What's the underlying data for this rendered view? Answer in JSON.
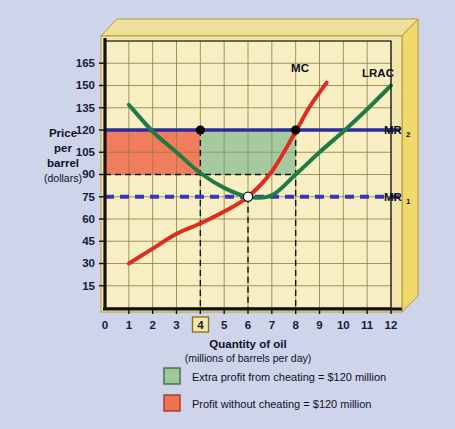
{
  "figure": {
    "background_color": "#ced4ea",
    "panel_color": "#f4e9b8",
    "frame_color": "#efdc8c",
    "frame_edge_color": "#c9ab3f"
  },
  "axes": {
    "y_label_line1": "Price",
    "y_label_line2": "per",
    "y_label_line3": "barrel",
    "y_label_line4": "(dollars)",
    "x_title": "Quantity of oil",
    "x_subtitle": "(millions of barrels per day)",
    "y_ticks": [
      "15",
      "30",
      "45",
      "60",
      "75",
      "90",
      "105",
      "120",
      "135",
      "150",
      "165"
    ],
    "x_ticks": [
      "0",
      "1",
      "2",
      "3",
      "4",
      "5",
      "6",
      "7",
      "8",
      "9",
      "10",
      "11",
      "12"
    ],
    "highlighted_x_tick": "4"
  },
  "curve_labels": {
    "mc": "MC",
    "lrac": "LRAC",
    "mr1_base": "MR",
    "mr1_sub": "1",
    "mr2_base": "MR",
    "mr2_sub": "2"
  },
  "legend": {
    "items": [
      {
        "swatch_color": "#9ec79c",
        "label": "Extra profit from cheating = $120 million"
      },
      {
        "swatch_color": "#ef7352",
        "label": "Profit without cheating = $120 million"
      }
    ]
  },
  "chart_data": {
    "type": "line",
    "title": "",
    "xlabel": "Quantity of oil (millions of barrels per day)",
    "ylabel": "Price per barrel (dollars)",
    "xlim": [
      0,
      12.6
    ],
    "ylim": [
      0,
      180
    ],
    "x_ticks": [
      0,
      1,
      2,
      3,
      4,
      5,
      6,
      7,
      8,
      9,
      10,
      11,
      12
    ],
    "y_ticks": [
      15,
      30,
      45,
      60,
      75,
      90,
      105,
      120,
      135,
      150,
      165
    ],
    "grid": true,
    "legend_position": "below-plot",
    "series": [
      {
        "name": "MC",
        "color": "#e02b20",
        "style": "solid",
        "points": [
          [
            1,
            30
          ],
          [
            2,
            40
          ],
          [
            3,
            50
          ],
          [
            4,
            57
          ],
          [
            5,
            65
          ],
          [
            6,
            75
          ],
          [
            7,
            92
          ],
          [
            8,
            119
          ],
          [
            8.6,
            136
          ],
          [
            9.3,
            152
          ]
        ]
      },
      {
        "name": "LRAC",
        "color": "#1f7a43",
        "style": "solid",
        "points": [
          [
            1,
            137
          ],
          [
            2,
            119
          ],
          [
            3,
            105
          ],
          [
            4,
            91
          ],
          [
            5,
            81
          ],
          [
            6,
            75
          ],
          [
            7,
            76
          ],
          [
            8,
            90
          ],
          [
            9,
            105
          ],
          [
            10,
            119
          ],
          [
            11,
            134
          ],
          [
            12,
            150
          ]
        ]
      },
      {
        "name": "MR2",
        "color": "#2b2b9e",
        "style": "solid",
        "points": [
          [
            0,
            120
          ],
          [
            12.6,
            120
          ]
        ]
      },
      {
        "name": "MR1",
        "color": "#3a35c0",
        "style": "dashed",
        "points": [
          [
            0,
            75
          ],
          [
            12.6,
            75
          ]
        ]
      }
    ],
    "markers": [
      {
        "name": "cartel-price-at-q4",
        "x": 4,
        "y": 120,
        "fill": "#000000"
      },
      {
        "name": "cheating-price-at-q8",
        "x": 8,
        "y": 120,
        "fill": "#000000"
      },
      {
        "name": "lrac-minimum",
        "x": 6,
        "y": 75,
        "fill": "#ffffff"
      }
    ],
    "guide_lines": [
      {
        "name": "q4-vertical",
        "orientation": "vertical",
        "x": 4,
        "from": 0,
        "to": 120
      },
      {
        "name": "q6-vertical",
        "orientation": "vertical",
        "x": 6,
        "from": 0,
        "to": 75
      },
      {
        "name": "q8-vertical",
        "orientation": "vertical",
        "x": 8,
        "from": 0,
        "to": 120
      },
      {
        "name": "p90-horizontal",
        "orientation": "horizontal",
        "y": 90,
        "from": 0,
        "to": 8
      }
    ],
    "shaded_regions": [
      {
        "name": "profit-without-cheating",
        "color": "#ef7352",
        "x_from": 0,
        "x_to": 4,
        "y_from": 90,
        "y_to": 120,
        "label": "Profit without cheating = $120 million"
      },
      {
        "name": "extra-profit-from-cheating",
        "color": "#9ec79c",
        "x_from": 4,
        "x_to": 8,
        "y_from": 90,
        "y_to": 120,
        "label": "Extra profit from cheating = $120 million"
      }
    ]
  }
}
